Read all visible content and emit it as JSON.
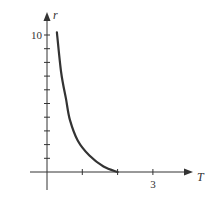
{
  "chart_data": {
    "type": "line",
    "title": "",
    "xlabel": "T",
    "ylabel": "r",
    "xlim": [
      -0.45,
      4.0
    ],
    "ylim": [
      -1.3,
      11.2
    ],
    "x_ticks": [
      1,
      2,
      3
    ],
    "x_tick_labels": [
      "",
      "",
      "3"
    ],
    "y_ticks": [
      1,
      2,
      3,
      4,
      5,
      6,
      7,
      8,
      9,
      10
    ],
    "y_tick_labels": [
      "",
      "",
      "",
      "",
      "",
      "",
      "",
      "",
      "",
      "10"
    ],
    "grid": false,
    "legend": null,
    "series": [
      {
        "name": "r(T)",
        "color": "#333333",
        "x": [
          0.28,
          0.4,
          0.54,
          0.65,
          0.87,
          1.2,
          1.6,
          2.0
        ],
        "y": [
          10.2,
          7.3,
          5.3,
          3.8,
          2.3,
          1.2,
          0.4,
          0.0
        ]
      }
    ]
  },
  "labels": {
    "x_axis": "T",
    "y_axis": "r",
    "x_tick_3": "3",
    "y_tick_10": "10"
  },
  "colors": {
    "axis": "#333333",
    "curve": "#333333"
  }
}
